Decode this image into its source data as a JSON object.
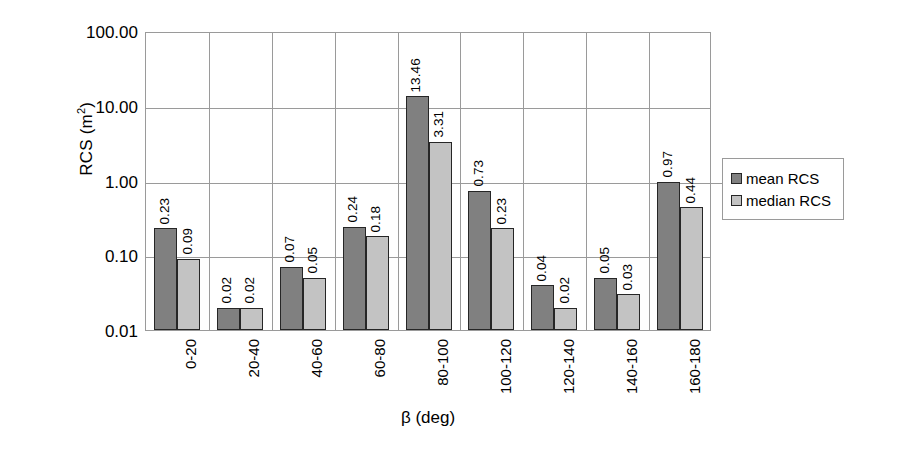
{
  "chart_data": {
    "type": "bar",
    "title": "",
    "xlabel": "β (deg)",
    "ylabel": "RCS (m²)",
    "ylabel_base": "RCS (m",
    "ylabel_sup": "2",
    "ylabel_tail": ")",
    "yscale": "log",
    "ylim": [
      0.01,
      100
    ],
    "grid": true,
    "legend_position": "right",
    "categories": [
      "0-20",
      "20-40",
      "40-60",
      "60-80",
      "80-100",
      "100-120",
      "120-140",
      "140-160",
      "160-180"
    ],
    "ytick_labels": [
      "100.00",
      "10.00",
      "1.00",
      "0.10",
      "0.01"
    ],
    "ytick_values": [
      100,
      10,
      1,
      0.1,
      0.01
    ],
    "series": [
      {
        "name": "mean RCS",
        "color": "#808080",
        "values": [
          0.23,
          0.02,
          0.07,
          0.24,
          13.46,
          0.73,
          0.04,
          0.05,
          0.97
        ],
        "labels": [
          "0.23",
          "0.02",
          "0.07",
          "0.24",
          "13.46",
          "0.73",
          "0.04",
          "0.05",
          "0.97"
        ]
      },
      {
        "name": "median RCS",
        "color": "#c3c3c3",
        "values": [
          0.09,
          0.02,
          0.05,
          0.18,
          3.31,
          0.23,
          0.02,
          0.03,
          0.44
        ],
        "labels": [
          "0.09",
          "0.02",
          "0.05",
          "0.18",
          "3.31",
          "0.23",
          "0.02",
          "0.03",
          "0.44"
        ]
      }
    ]
  },
  "legend": {
    "items": [
      {
        "label": "mean RCS",
        "swatch": "mean"
      },
      {
        "label": "median RCS",
        "swatch": "median"
      }
    ]
  }
}
